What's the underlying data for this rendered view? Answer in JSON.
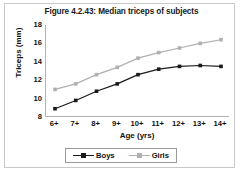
{
  "figure": {
    "title": "Figure 4.2.43: Median triceps of subjects",
    "background_color": "#ffffff",
    "frame_color": "#c9c9c9"
  },
  "chart_data": {
    "type": "line",
    "title": "Figure 4.2.43: Median triceps of subjects",
    "xlabel": "Age (yrs)",
    "ylabel": "Triceps (mm)",
    "categories": [
      "6+",
      "7+",
      "8+",
      "9+",
      "10+",
      "11+",
      "12+",
      "13+",
      "14+"
    ],
    "ylim": [
      8,
      18
    ],
    "yticks": [
      8,
      10,
      12,
      14,
      16,
      18
    ],
    "grid": false,
    "legend_position": "bottom",
    "series": [
      {
        "name": "Boys",
        "color": "#1a1a1a",
        "marker": "square",
        "values": [
          8.9,
          9.8,
          10.8,
          11.6,
          12.6,
          13.2,
          13.5,
          13.6,
          13.5
        ]
      },
      {
        "name": "Girls",
        "color": "#b0b0b0",
        "marker": "square",
        "values": [
          11.0,
          11.6,
          12.6,
          13.4,
          14.4,
          15.0,
          15.5,
          16.0,
          16.4
        ]
      }
    ]
  }
}
